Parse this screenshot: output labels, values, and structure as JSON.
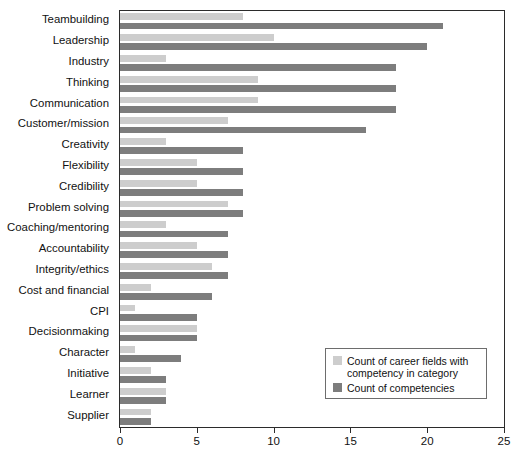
{
  "chart_data": {
    "type": "bar",
    "orientation": "horizontal",
    "title": "",
    "subtitle": "",
    "xlabel": "",
    "ylabel": "",
    "xlim": [
      0,
      25
    ],
    "xticks": [
      0,
      5,
      10,
      15,
      20,
      25
    ],
    "xtick_labels": [
      "0",
      "5",
      "10",
      "15",
      "20",
      "25"
    ],
    "grid": false,
    "legend_position": "inside-lower-right",
    "categories": [
      "Teambuilding",
      "Leadership",
      "Industry",
      "Thinking",
      "Communication",
      "Customer/mission",
      "Creativity",
      "Flexibility",
      "Credibility",
      "Problem solving",
      "Coaching/mentoring",
      "Accountability",
      "Integrity/ethics",
      "Cost and financial",
      "CPI",
      "Decisionmaking",
      "Character",
      "Initiative",
      "Learner",
      "Supplier"
    ],
    "series": [
      {
        "name": "Count of career fields with competency in category",
        "color": "#cdcdcd",
        "values": [
          8,
          10,
          3,
          9,
          9,
          7,
          3,
          5,
          5,
          7,
          3,
          5,
          6,
          2,
          1,
          5,
          1,
          2,
          3,
          2
        ]
      },
      {
        "name": "Count of competencies",
        "color": "#7d7d7d",
        "values": [
          21,
          20,
          18,
          18,
          18,
          16,
          8,
          8,
          8,
          8,
          7,
          7,
          7,
          6,
          5,
          5,
          4,
          3,
          3,
          2
        ]
      }
    ]
  },
  "legend": {
    "entries": [
      {
        "label": "Count of career fields with competency in category",
        "swatch": "light"
      },
      {
        "label": "Count of competencies",
        "swatch": "dark"
      }
    ]
  },
  "colors": {
    "series_light": "#cdcdcd",
    "series_dark": "#7d7d7d",
    "axis": "#2b2b2b",
    "text": "#111111",
    "background": "#ffffff"
  }
}
